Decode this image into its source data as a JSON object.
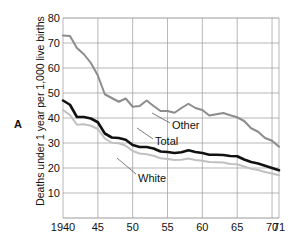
{
  "figure": {
    "panel_letter": "A",
    "ylabel": "Deaths under 1 year per 1,000 live births"
  },
  "chart_data": {
    "type": "line",
    "title": "",
    "subtitle": "",
    "xlabel": "",
    "ylabel": "Deaths under 1 year per 1,000 live births",
    "xlim": [
      1940,
      1971
    ],
    "ylim": [
      0,
      80
    ],
    "yticks": [
      10,
      20,
      30,
      40,
      50,
      60,
      70,
      80
    ],
    "ytick_labels": [
      "10",
      "20",
      "30",
      "40",
      "50",
      "60",
      "70",
      "80"
    ],
    "xticks": [
      1940,
      1945,
      1950,
      1955,
      1960,
      1965,
      1970,
      1971
    ],
    "xtick_labels": [
      "1940",
      "45",
      "50",
      "55",
      "60",
      "65",
      "70",
      "71"
    ],
    "grid": true,
    "legend": "inline-annotations",
    "annotations": [
      {
        "text": "Other",
        "series": "Other"
      },
      {
        "text": "Total",
        "series": "Total"
      },
      {
        "text": "White",
        "series": "White"
      }
    ],
    "x": [
      1940,
      1941,
      1942,
      1943,
      1944,
      1945,
      1946,
      1947,
      1948,
      1949,
      1950,
      1951,
      1952,
      1953,
      1954,
      1955,
      1956,
      1957,
      1958,
      1959,
      1960,
      1961,
      1962,
      1963,
      1964,
      1965,
      1966,
      1967,
      1968,
      1969,
      1970,
      1971
    ],
    "series": [
      {
        "name": "Other",
        "color": "#8c8c8c",
        "values": [
          73.0,
          72.8,
          68.0,
          65.5,
          62.0,
          57.0,
          49.5,
          48.0,
          46.5,
          47.8,
          44.5,
          44.8,
          47.0,
          44.8,
          42.8,
          42.8,
          42.1,
          44.0,
          45.7,
          44.0,
          43.2,
          41.0,
          41.5,
          42.0,
          41.1,
          40.3,
          38.8,
          35.9,
          34.5,
          32.0,
          30.9,
          28.5
        ]
      },
      {
        "name": "Total",
        "color": "#111111",
        "values": [
          47.0,
          45.3,
          40.4,
          40.4,
          39.8,
          38.3,
          33.8,
          32.2,
          32.0,
          31.3,
          29.2,
          28.4,
          28.4,
          27.8,
          26.6,
          26.4,
          26.0,
          26.3,
          27.1,
          26.4,
          26.0,
          25.3,
          25.3,
          25.2,
          24.8,
          24.7,
          23.4,
          22.4,
          21.8,
          20.9,
          20.0,
          19.1
        ]
      },
      {
        "name": "White",
        "color": "#c0c0c0",
        "values": [
          43.2,
          41.2,
          37.3,
          37.5,
          36.9,
          35.6,
          31.8,
          30.1,
          29.9,
          28.9,
          26.8,
          25.8,
          25.5,
          24.9,
          23.9,
          23.6,
          23.2,
          23.3,
          23.8,
          23.2,
          22.9,
          22.4,
          22.3,
          22.2,
          21.6,
          21.5,
          20.6,
          19.7,
          19.2,
          18.4,
          17.8,
          17.1
        ]
      }
    ]
  }
}
